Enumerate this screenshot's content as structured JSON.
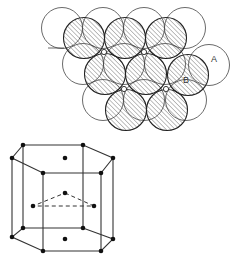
{
  "figure": {
    "top_panel": {
      "title": "close-packed layers (top view)",
      "layer_a": {
        "style": "open",
        "radius": 20.5,
        "centers": [
          [
            62,
            28
          ],
          [
            103,
            28
          ],
          [
            144,
            28
          ],
          [
            185,
            28
          ],
          [
            83,
            64
          ],
          [
            124,
            64
          ],
          [
            165,
            64
          ],
          [
            209,
            65
          ],
          [
            103,
            100
          ],
          [
            144,
            100
          ],
          [
            186,
            100
          ]
        ]
      },
      "layer_b": {
        "style": "hatched",
        "radius": 20.5,
        "centers": [
          [
            84,
            38
          ],
          [
            125,
            38
          ],
          [
            166,
            38
          ],
          [
            105,
            74
          ],
          [
            146,
            74
          ],
          [
            188,
            75
          ],
          [
            126,
            110
          ],
          [
            167,
            110
          ]
        ]
      },
      "voids": [
        [
          104,
          52
        ],
        [
          144,
          52
        ],
        [
          124,
          89
        ],
        [
          166,
          89
        ]
      ],
      "labels": [
        {
          "text": "A",
          "x": 211,
          "y": 62
        },
        {
          "text": "B",
          "x": 183,
          "y": 83
        }
      ],
      "stroke": "#444444",
      "hatch_color": "#8a8a8a"
    },
    "bottom_panel": {
      "title": "hexagonal close-packed unit cell",
      "top_hexagon": [
        [
          23,
          145
        ],
        [
          83,
          145
        ],
        [
          113,
          158
        ],
        [
          101,
          173
        ],
        [
          43,
          173
        ],
        [
          12,
          158
        ]
      ],
      "bottom_hexagon": [
        [
          23,
          228
        ],
        [
          83,
          228
        ],
        [
          113,
          239
        ],
        [
          101,
          251
        ],
        [
          43,
          251
        ],
        [
          12,
          237
        ]
      ],
      "top_center": [
        65,
        158
      ],
      "bottom_center": [
        65,
        239
      ],
      "middle_triangle": [
        [
          65,
          193
        ],
        [
          94,
          206
        ],
        [
          33,
          206
        ]
      ],
      "stroke": "#333333"
    }
  }
}
